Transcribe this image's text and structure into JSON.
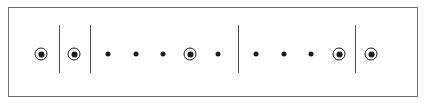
{
  "figure": {
    "type": "marker-row-diagram",
    "width": 426,
    "height": 107,
    "background_color": "#ffffff",
    "frame": {
      "x": 8,
      "y": 7,
      "width": 410,
      "height": 90,
      "border_color": "#6e6e6e",
      "border_width": 1,
      "fill_color": "#ffffff"
    },
    "axis": {
      "row_center_y": 54
    },
    "style": {
      "plain_dot": {
        "diameter": 5,
        "color": "#1a1a1a"
      },
      "circled_dot": {
        "outer_diameter": 13,
        "ring_width": 1,
        "ring_color": "#1a1a1a",
        "core_diameter": 6,
        "core_color": "#1a1a1a"
      },
      "divider": {
        "width": 1,
        "color": "#4d4d4d",
        "top_y": 25,
        "bottom_y": 73
      }
    },
    "dividers": [
      {
        "name": "divider-1",
        "x": 59
      },
      {
        "name": "divider-2",
        "x": 90
      },
      {
        "name": "divider-3",
        "x": 238
      },
      {
        "name": "divider-4",
        "x": 355
      }
    ],
    "markers": [
      {
        "name": "marker-1",
        "x": 41,
        "kind": "circled"
      },
      {
        "name": "marker-2",
        "x": 74,
        "kind": "circled"
      },
      {
        "name": "marker-3",
        "x": 108,
        "kind": "plain"
      },
      {
        "name": "marker-4",
        "x": 136,
        "kind": "plain"
      },
      {
        "name": "marker-5",
        "x": 163,
        "kind": "plain"
      },
      {
        "name": "marker-6",
        "x": 190,
        "kind": "circled"
      },
      {
        "name": "marker-7",
        "x": 218,
        "kind": "plain"
      },
      {
        "name": "marker-8",
        "x": 256,
        "kind": "plain"
      },
      {
        "name": "marker-9",
        "x": 284,
        "kind": "plain"
      },
      {
        "name": "marker-10",
        "x": 311,
        "kind": "plain"
      },
      {
        "name": "marker-11",
        "x": 339,
        "kind": "circled"
      },
      {
        "name": "marker-12",
        "x": 371,
        "kind": "circled"
      }
    ],
    "groups": [
      {
        "name": "group-1",
        "marker_count": 1
      },
      {
        "name": "group-2",
        "marker_count": 1
      },
      {
        "name": "group-3",
        "marker_count": 5
      },
      {
        "name": "group-4",
        "marker_count": 4
      },
      {
        "name": "group-5",
        "marker_count": 1
      }
    ]
  }
}
